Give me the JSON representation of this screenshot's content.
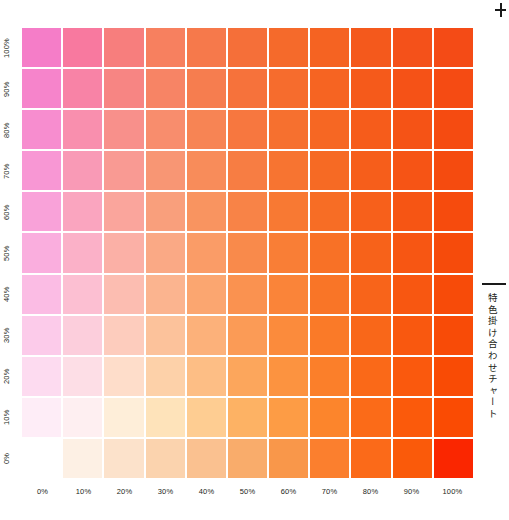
{
  "chart_data": {
    "type": "heatmap",
    "title": "特色掛け合わせチャート",
    "xlabel": "",
    "ylabel": "",
    "x": [
      0,
      10,
      20,
      30,
      40,
      50,
      60,
      70,
      80,
      90,
      100
    ],
    "y": [
      0,
      10,
      20,
      30,
      40,
      50,
      60,
      70,
      80,
      90,
      100
    ],
    "x_tick_labels": [
      "0%",
      "10%",
      "20%",
      "30%",
      "40%",
      "50%",
      "60%",
      "70%",
      "80%",
      "90%",
      "100%"
    ],
    "y_tick_labels": [
      "0%",
      "10%",
      "20%",
      "30%",
      "40%",
      "50%",
      "60%",
      "70%",
      "80%",
      "90%",
      "100%"
    ],
    "y_tick_labels_top_to_bottom": [
      "100%",
      "90%",
      "80%",
      "70%",
      "60%",
      "50%",
      "40%",
      "30%",
      "20%",
      "10%",
      "0%"
    ],
    "grid": false,
    "legend": "none",
    "ink_axis_x": "orange spot ink",
    "ink_axis_y": "magenta spot ink",
    "base_color_x_100": "#FA2600",
    "base_color_y_100": "#F57DC8",
    "rows_top_to_bottom": [
      {
        "magenta": 100,
        "colors": [
          "#F57DC8",
          "#F8799F",
          "#F77E7D",
          "#F7805F",
          "#F6794B",
          "#F56F39",
          "#F56A2B",
          "#F56322",
          "#F4591C",
          "#F4511A",
          "#F44B16"
        ]
      },
      {
        "magenta": 90,
        "colors": [
          "#F684CB",
          "#F883A6",
          "#F78583",
          "#F78465",
          "#F67D4F",
          "#F6723B",
          "#F66C2D",
          "#F66422",
          "#F55A1B",
          "#F55217",
          "#F54B13"
        ]
      },
      {
        "magenta": 80,
        "colors": [
          "#F78DCF",
          "#F98FAE",
          "#F8908B",
          "#F88D6D",
          "#F78454",
          "#F7773F",
          "#F6702F",
          "#F66723",
          "#F65C1B",
          "#F55316",
          "#F54B11"
        ]
      },
      {
        "magenta": 70,
        "colors": [
          "#F897D4",
          "#F99AB6",
          "#F99A93",
          "#F89674",
          "#F88C5A",
          "#F77D43",
          "#F77431",
          "#F66A24",
          "#F65E1B",
          "#F65415",
          "#F54B0F"
        ]
      },
      {
        "magenta": 60,
        "colors": [
          "#F9A2D9",
          "#FAA5BF",
          "#FAA59C",
          "#F99F7C",
          "#F99460",
          "#F88347",
          "#F87933",
          "#F76D25",
          "#F7601B",
          "#F65514",
          "#F64B0D"
        ]
      },
      {
        "magenta": 50,
        "colors": [
          "#FAAEDE",
          "#FBB1C8",
          "#FBB0A6",
          "#FAA985",
          "#FA9C67",
          "#F98A4B",
          "#F97E36",
          "#F87126",
          "#F7621A",
          "#F75613",
          "#F64B0B"
        ]
      },
      {
        "magenta": 40,
        "colors": [
          "#FBBCE4",
          "#FCBFD2",
          "#FCBDB1",
          "#FBB48F",
          "#FBA670",
          "#FA9250",
          "#FA8439",
          "#F97527",
          "#F8641A",
          "#F85711",
          "#F74B09"
        ]
      },
      {
        "magenta": 30,
        "colors": [
          "#FCCBEA",
          "#FCCEDC",
          "#FDCCBD",
          "#FCC29B",
          "#FCB17A",
          "#FB9B56",
          "#FB8B3C",
          "#FA7A28",
          "#F96719",
          "#F9580F",
          "#F84B07"
        ]
      },
      {
        "magenta": 20,
        "colors": [
          "#FDDBF0",
          "#FDDEE6",
          "#FEDDCA",
          "#FDD1A9",
          "#FDBE85",
          "#FCA65C",
          "#FC9340",
          "#FB7F2A",
          "#FA6918",
          "#FA590D",
          "#F94B05"
        ]
      },
      {
        "magenta": 10,
        "colors": [
          "#FEEDF7",
          "#FEEFF1",
          "#FEEED9",
          "#FEE3BA",
          "#FECD92",
          "#FDB264",
          "#FD9C45",
          "#FC852C",
          "#FB6B18",
          "#FB5A0B",
          "#FA4B03"
        ]
      },
      {
        "magenta": 0,
        "colors": [
          "#FFFFFF",
          "#FDF0E4",
          "#FCE2CB",
          "#FBD3AE",
          "#FAC190",
          "#F9AC6B",
          "#F9974A",
          "#FB7F2E",
          "#FB6A19",
          "#FA5A0A",
          "#FA2600"
        ]
      }
    ]
  },
  "caption": {
    "text": "特色掛け合わせチャート"
  },
  "icons": {
    "crop_mark": "crop-mark-icon"
  }
}
